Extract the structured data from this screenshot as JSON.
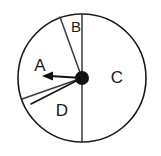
{
  "figure": {
    "type": "spinner-wheel",
    "background_color": "#ffffff",
    "outline_color": "#1a1a1a",
    "divider_color": "#3a3a3a",
    "pointer_color": "#111111",
    "label_color": "#1a1a1a"
  },
  "wheel": {
    "center_x": 82,
    "center_y": 78,
    "radius": 64,
    "outline_width": 1.6
  },
  "sectors": [
    {
      "id": "sector-a",
      "label": "A",
      "label_x": 40,
      "label_y": 67,
      "start_angle_deg": 340,
      "end_angle_deg": 199,
      "sweep_deg": 219
    },
    {
      "id": "sector-b",
      "label": "B",
      "label_x": 76,
      "label_y": 27,
      "start_angle_deg": 340,
      "end_angle_deg": 360,
      "sweep_deg": 20
    },
    {
      "id": "sector-c",
      "label": "C",
      "label_x": 116,
      "label_y": 78,
      "start_angle_deg": 0,
      "end_angle_deg": 180,
      "sweep_deg": 180
    },
    {
      "id": "sector-d",
      "label": "D",
      "label_x": 62,
      "label_y": 112,
      "start_angle_deg": 180,
      "end_angle_deg": 199,
      "sweep_deg": 19
    }
  ],
  "dividers": [
    {
      "id": "divider-top-vertical",
      "to_x": 82,
      "to_y": 14,
      "angle_deg": 0
    },
    {
      "id": "divider-upper-left",
      "to_x": 60,
      "to_y": 17,
      "angle_deg": 340
    },
    {
      "id": "divider-lower-left",
      "to_x": 22,
      "to_y": 99,
      "angle_deg": 199
    },
    {
      "id": "divider-bottom-vertical",
      "to_x": 82,
      "to_y": 142,
      "angle_deg": 180
    }
  ],
  "pointer": {
    "id": "spinner-pointer",
    "direction": "left",
    "heading_deg": 270,
    "tip_x": 44,
    "tip_y": 76,
    "tail_x": 34,
    "tail_y": 103,
    "hub_radius": 7
  }
}
